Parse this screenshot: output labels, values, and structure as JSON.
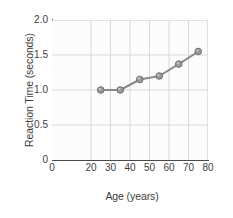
{
  "chart_data": {
    "type": "line",
    "title": "",
    "xlabel": "Age (years)",
    "ylabel": "Reaction Time (seconds)",
    "x": [
      25,
      35,
      45,
      55,
      65,
      75
    ],
    "values": [
      1.0,
      1.0,
      1.15,
      1.2,
      1.37,
      1.55
    ],
    "series": [
      {
        "name": "Reaction Time",
        "values": [
          1.0,
          1.0,
          1.15,
          1.2,
          1.37,
          1.55
        ]
      }
    ],
    "xlim": [
      0,
      80
    ],
    "ylim": [
      0,
      2.0
    ],
    "x_ticks": [
      0,
      20,
      30,
      40,
      50,
      60,
      70,
      80
    ],
    "x_tick_labels": [
      "0",
      "20",
      "30",
      "40",
      "50",
      "60",
      "70",
      "80"
    ],
    "y_ticks": [
      0,
      0.5,
      1.0,
      1.5,
      2.0
    ],
    "y_tick_labels": [
      "0",
      "0.5",
      "1.0",
      "1.5",
      "2.0"
    ],
    "grid": true,
    "legend": "none",
    "marker": "circle",
    "colors": {
      "line": "#8a8a8a",
      "marker_fill": "#9a9a9a",
      "marker_edge": "#707070",
      "grid": "#d9d9d9",
      "axis": "#4a4a4a",
      "plot_background": "#fcfcfc",
      "figure_background": "#ffffff",
      "text": "#3d3d3d"
    }
  }
}
